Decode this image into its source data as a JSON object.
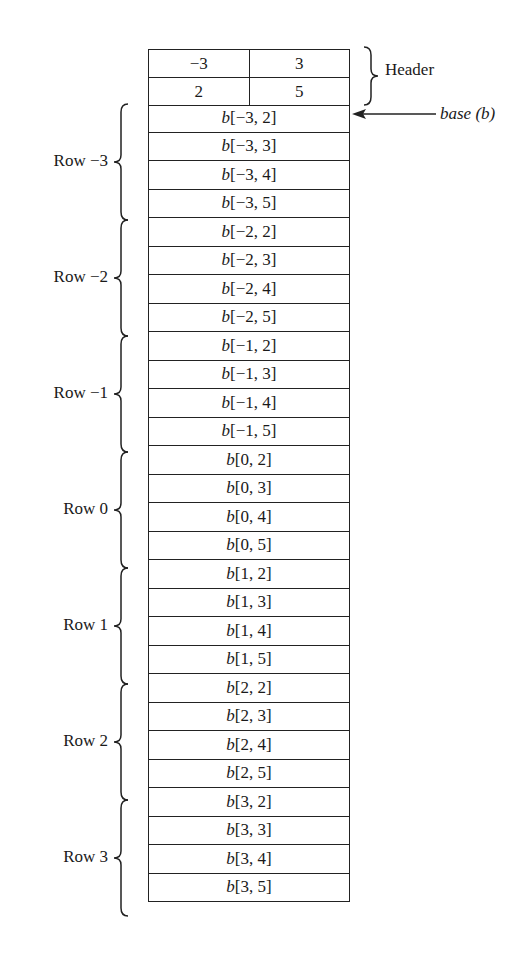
{
  "header": {
    "label": "Header",
    "rows": [
      {
        "cells": [
          "−3",
          "3"
        ]
      },
      {
        "cells": [
          "2",
          "5"
        ]
      }
    ]
  },
  "base_label": "base (b)",
  "row_groups": [
    {
      "label": "Row −3",
      "cells": [
        "b[−3, 2]",
        "b[−3, 3]",
        "b[−3, 4]",
        "b[−3, 5]"
      ]
    },
    {
      "label": "Row −2",
      "cells": [
        "b[−2, 2]",
        "b[−2, 3]",
        "b[−2, 4]",
        "b[−2, 5]"
      ]
    },
    {
      "label": "Row −1",
      "cells": [
        "b[−1, 2]",
        "b[−1, 3]",
        "b[−1, 4]",
        "b[−1, 5]"
      ]
    },
    {
      "label": "Row 0",
      "cells": [
        "b[0, 2]",
        "b[0, 3]",
        "b[0, 4]",
        "b[0, 5]"
      ]
    },
    {
      "label": "Row 1",
      "cells": [
        "b[1, 2]",
        "b[1, 3]",
        "b[1, 4]",
        "b[1, 5]"
      ]
    },
    {
      "label": "Row 2",
      "cells": [
        "b[2, 2]",
        "b[2, 3]",
        "b[2, 4]",
        "b[2, 5]"
      ]
    },
    {
      "label": "Row 3",
      "cells": [
        "b[3, 2]",
        "b[3, 3]",
        "b[3, 4]",
        "b[3, 5]"
      ]
    }
  ]
}
